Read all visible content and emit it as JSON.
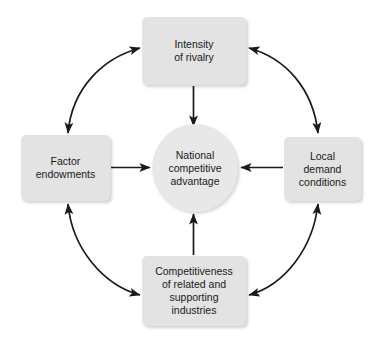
{
  "diagram": {
    "background_color": "#ffffff",
    "node_fill_color": "#e3e3e3",
    "center_fill_color": "#e8e8e8",
    "arrow_color": "#1a1a1a",
    "text_color": "#1a1a1a"
  },
  "nodes": {
    "center": {
      "label": "National\ncompetitive\nadvantage",
      "shape": "circle"
    },
    "top": {
      "label": "Intensity\nof rivalry",
      "shape": "rounded-rect"
    },
    "left": {
      "label": "Factor\nendowments",
      "shape": "rounded-rect"
    },
    "right": {
      "label": "Local\ndemand\nconditions",
      "shape": "rounded-rect"
    },
    "bottom": {
      "label": "Competitiveness\nof related and\nsupporting\nindustries",
      "shape": "rounded-rect"
    }
  },
  "connections": [
    {
      "from": "top",
      "to": "center",
      "style": "straight",
      "heads": "single"
    },
    {
      "from": "left",
      "to": "center",
      "style": "straight",
      "heads": "single"
    },
    {
      "from": "right",
      "to": "center",
      "style": "straight",
      "heads": "single"
    },
    {
      "from": "bottom",
      "to": "center",
      "style": "straight",
      "heads": "single"
    },
    {
      "from": "left",
      "to": "top",
      "style": "curved",
      "heads": "double"
    },
    {
      "from": "top",
      "to": "right",
      "style": "curved",
      "heads": "double"
    },
    {
      "from": "left",
      "to": "bottom",
      "style": "curved",
      "heads": "double"
    },
    {
      "from": "bottom",
      "to": "right",
      "style": "curved",
      "heads": "double"
    }
  ]
}
